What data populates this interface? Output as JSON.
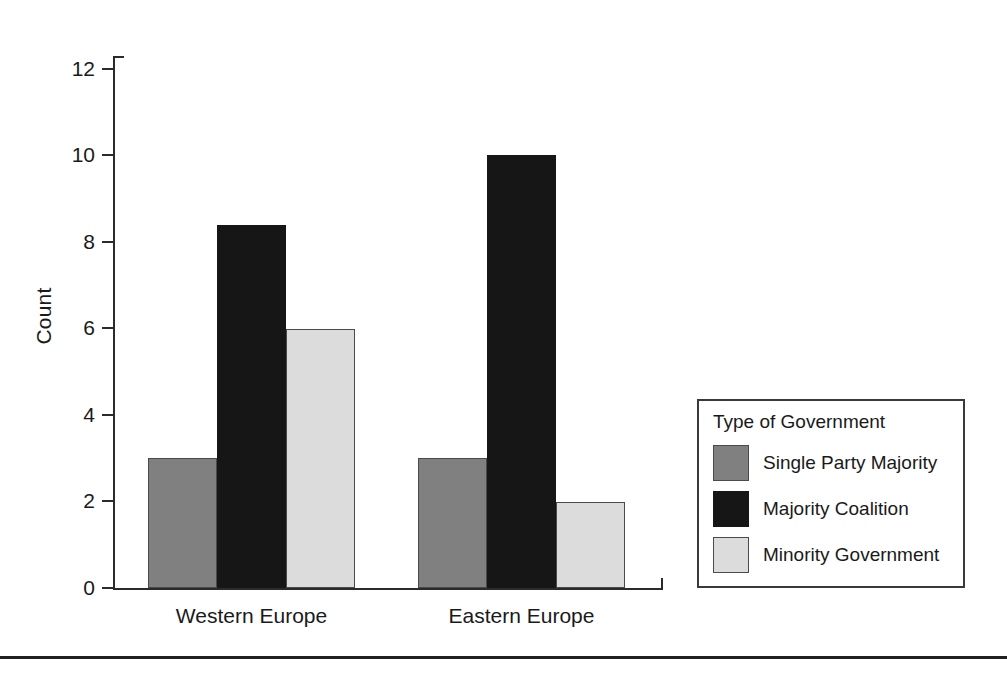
{
  "chart_data": {
    "type": "bar",
    "title": "",
    "xlabel": "",
    "ylabel": "Count",
    "categories": [
      "Western Europe",
      "Eastern Europe"
    ],
    "series": [
      {
        "name": "Single Party Majority",
        "color": "#808080",
        "values": [
          3,
          3
        ]
      },
      {
        "name": "Majority Coalition",
        "color": "#161616",
        "values": [
          8.4,
          10
        ]
      },
      {
        "name": "Minority Government",
        "color": "#dcdcdc",
        "values": [
          6,
          2
        ]
      }
    ],
    "ylim": [
      0,
      12.3
    ],
    "yticks": [
      0,
      2,
      4,
      6,
      8,
      10,
      12
    ],
    "ytick_labels": [
      "0",
      "2",
      "4",
      "6",
      "8",
      "10",
      "12"
    ],
    "grid": false,
    "legend": {
      "title": "Type of Government",
      "position": "right-bottom",
      "entries": [
        {
          "label": "Single Party Majority",
          "swatch": "#808080"
        },
        {
          "label": "Majority Coalition",
          "swatch": "#161616"
        },
        {
          "label": "Minority Government",
          "swatch": "#dcdcdc"
        }
      ]
    }
  },
  "axis": {
    "ylabel": "Count",
    "ticks": [
      "0",
      "2",
      "4",
      "6",
      "8",
      "10",
      "12"
    ],
    "categories": [
      "Western Europe",
      "Eastern Europe"
    ]
  },
  "legend": {
    "title": "Type of Government",
    "items": [
      {
        "label": "Single Party Majority"
      },
      {
        "label": "Majority Coalition"
      },
      {
        "label": "Minority Government"
      }
    ]
  }
}
